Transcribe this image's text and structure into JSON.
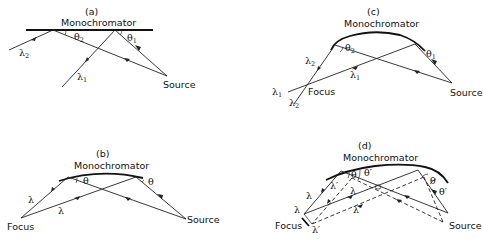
{
  "panels": {
    "a": {
      "label": "(a)",
      "mirror_label": "Monochromator",
      "source_label": "Source",
      "theta1": "θ",
      "theta1_sub": "1",
      "theta2": "θ",
      "theta2_sub": "2",
      "lambda1": "λ",
      "lambda1_sub": "1",
      "lambda2": "λ",
      "lambda2_sub": "2"
    },
    "b": {
      "label": "(b)",
      "mirror_label": "Monochromator",
      "source_label": "Source",
      "focus_label": "Focus",
      "theta_left": "θ",
      "theta_right": "θ",
      "lambda_upper": "λ",
      "lambda_lower": "λ"
    },
    "c": {
      "label": "(c)",
      "mirror_label": "Monochromator",
      "source_label": "Source",
      "focus_label": "Focus",
      "theta1": "θ",
      "theta1_sub": "1",
      "theta2": "θ",
      "theta2_sub": "2",
      "lambda1_ray": "λ",
      "lambda1_ray_sub": "1",
      "lambda2_ray": "λ",
      "lambda2_ray_sub": "2",
      "lambda1_end": "λ",
      "lambda1_end_sub": "1",
      "lambda2_end": "λ",
      "lambda2_end_sub": "2"
    },
    "d": {
      "label": "(d)",
      "mirror_label": "Monochromator",
      "source_label": "Source",
      "focus_label": "Focus",
      "theta_left": "θ",
      "theta_left_prime": "θ′",
      "theta_right": "θ",
      "theta_right_prime": "θ′",
      "lambda_left": "λ",
      "lambda_left_prime": "λ′",
      "lambda_mid": "λ",
      "lambda_mid_prime": "λ′",
      "lambda_focus": "λ",
      "lambda_focus_prime": "λ′"
    }
  }
}
